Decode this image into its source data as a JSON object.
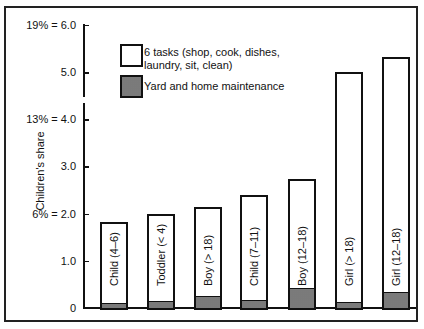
{
  "chart_data": {
    "type": "bar",
    "stacked": true,
    "title": "",
    "xlabel": "",
    "ylabel": "Children's share",
    "ylim": [
      0,
      6.0
    ],
    "y_axis_break": "between 4.0 and 5.0",
    "y_ticks": [
      {
        "value": 0,
        "label": "0"
      },
      {
        "value": 1.0,
        "label": "1.0"
      },
      {
        "value": 2.0,
        "label": "6% = 2.0"
      },
      {
        "value": 3.0,
        "label": "3.0"
      },
      {
        "value": 4.0,
        "label": "13% = 4.0"
      },
      {
        "value": 5.0,
        "label": "5.0"
      },
      {
        "value": 6.0,
        "label": "19% = 6.0"
      }
    ],
    "categories": [
      "Child (4–6)",
      "Toddler (< 4)",
      "Boy (> 18)",
      "Child (7–11)",
      "Boy (12–18)",
      "Girl (> 18)",
      "Girl (12–18)"
    ],
    "series": [
      {
        "name": "Yard and home maintenance",
        "fill": "hatched",
        "values": [
          0.12,
          0.15,
          0.27,
          0.17,
          0.43,
          0.13,
          0.36
        ]
      },
      {
        "name": "6 tasks (shop, cook, dishes, laundry, sit, clean)",
        "fill": "white",
        "values": [
          1.71,
          1.85,
          1.88,
          2.23,
          2.31,
          4.87,
          4.96
        ]
      }
    ],
    "totals": [
      1.83,
      2.0,
      2.15,
      2.4,
      2.74,
      5.0,
      5.32
    ],
    "legend": {
      "position": "upper-left-inside",
      "entries": [
        {
          "label_line1": "6 tasks (shop, cook, dishes,",
          "label_line2": "laundry, sit, clean)",
          "fill": "white"
        },
        {
          "label_line1": "Yard and home maintenance",
          "fill": "hatched"
        }
      ]
    },
    "grid": false
  }
}
